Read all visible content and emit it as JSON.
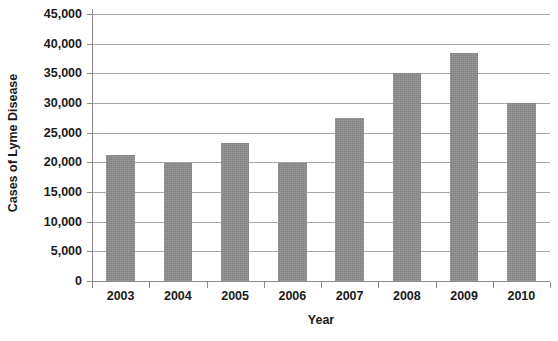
{
  "chart_data": {
    "type": "bar",
    "title": "",
    "xlabel": "Year",
    "ylabel": "Cases of Lyme Disease",
    "categories": [
      "2003",
      "2004",
      "2005",
      "2006",
      "2007",
      "2008",
      "2009",
      "2010"
    ],
    "values": [
      21300,
      19900,
      23300,
      19900,
      27400,
      35000,
      38400,
      30000
    ],
    "ylim": [
      0,
      45000
    ],
    "y_ticks": [
      0,
      5000,
      10000,
      15000,
      20000,
      25000,
      30000,
      35000,
      40000,
      45000
    ],
    "y_tick_labels": [
      "0",
      "5,000",
      "10,000",
      "15,000",
      "20,000",
      "25,000",
      "30,000",
      "35,000",
      "40,000",
      "45,000"
    ],
    "grid": true,
    "legend": "none",
    "series": [
      {
        "name": "Cases of Lyme Disease",
        "color": "#8d8d8d",
        "values": [
          21300,
          19900,
          23300,
          19900,
          27400,
          35000,
          38400,
          30000
        ]
      }
    ]
  },
  "axes": {
    "y_title": "Cases of Lyme Disease",
    "x_title": "Year"
  },
  "colors": {
    "bar": "#8d8d8d",
    "gridline": "#a6a6a6",
    "axis": "#8a8a8a",
    "text": "#1a1a1a",
    "background": "#ffffff"
  }
}
